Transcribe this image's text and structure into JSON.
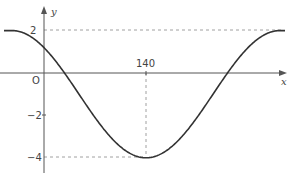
{
  "chart_data": {
    "type": "line",
    "title": "",
    "xlabel": "x",
    "ylabel": "y",
    "origin_label": "O",
    "x_ticks": [
      {
        "value": 140,
        "label": "140"
      }
    ],
    "y_ticks": [
      {
        "value": 2,
        "label": "2"
      },
      {
        "value": -2,
        "label": "−2"
      },
      {
        "value": -4,
        "label": "−4"
      }
    ],
    "series": [
      {
        "name": "curve",
        "function": "y = 3cos(πx/140... shifted) − 1",
        "description": "cosine-shaped curve, maximum 2, minimum −4 at x = 140",
        "max": 2,
        "min": -4,
        "min_x": 140,
        "points": [
          {
            "x": 0,
            "y": 2
          },
          {
            "x": 140,
            "y": -4
          },
          {
            "x": 280,
            "y": 2
          }
        ]
      }
    ],
    "guides": [
      {
        "type": "horizontal-dashed",
        "y": 2
      },
      {
        "type": "horizontal-dashed",
        "y": -4
      },
      {
        "type": "vertical-dashed",
        "x": 140
      }
    ],
    "ylim": [
      -4.7,
      3.1
    ],
    "grid": false,
    "colors": {
      "curve": "#333333",
      "axes": "#555555",
      "guides": "#888888"
    }
  }
}
